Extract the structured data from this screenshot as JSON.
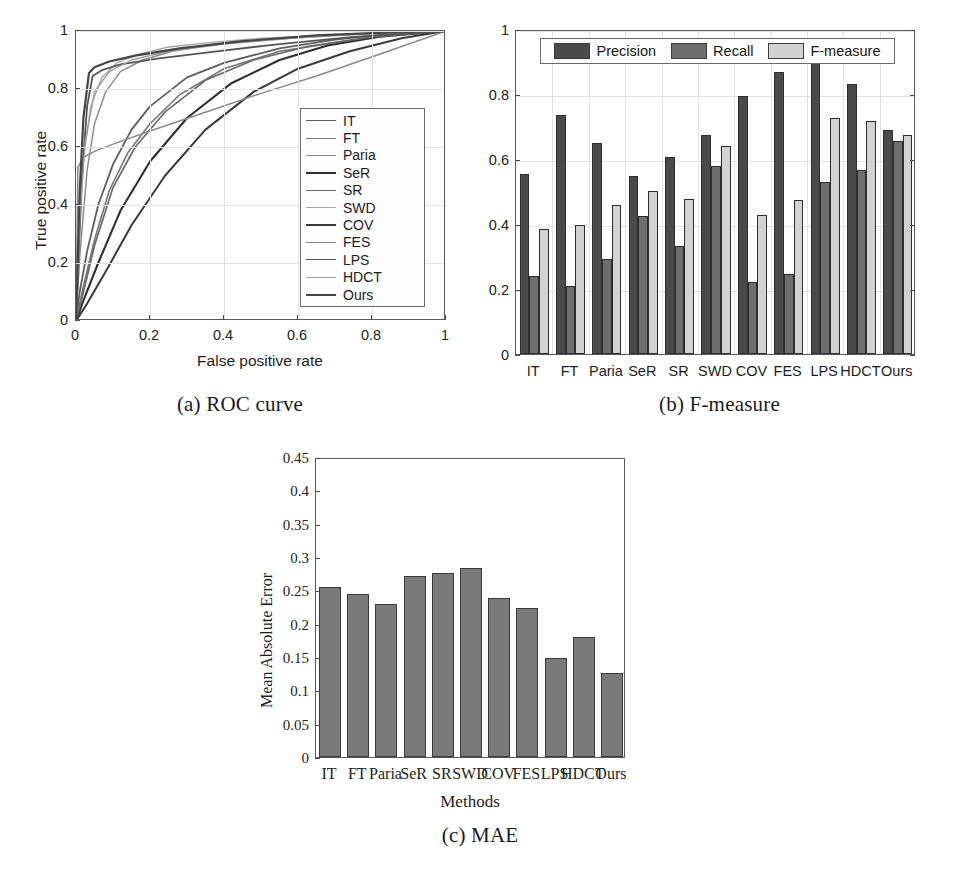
{
  "figure": {
    "panels": [
      {
        "key": "roc",
        "caption": "(a) ROC curve"
      },
      {
        "key": "fm",
        "caption": "(b) F-measure"
      },
      {
        "key": "mae",
        "caption": "(c) MAE"
      }
    ]
  },
  "colors": {
    "precision": "#4a4a4a",
    "recall": "#6e6e6e",
    "fmeasure": "#d2d2d2",
    "mae_bar": "#7a7a7a",
    "axis": "#5a5a5a",
    "grid": "#e3e3e3"
  },
  "methods": [
    "IT",
    "FT",
    "Paria",
    "SeR",
    "SR",
    "SWD",
    "COV",
    "FES",
    "LPS",
    "HDCT",
    "Ours"
  ],
  "chart_data": [
    {
      "id": "roc",
      "type": "line",
      "title": "(a) ROC curve",
      "xlabel": "False positive rate",
      "ylabel": "True positive rate",
      "xlim": [
        0,
        1
      ],
      "ylim": [
        0,
        1
      ],
      "xticks": [
        0,
        0.2,
        0.4,
        0.6,
        0.8,
        1
      ],
      "yticks": [
        0,
        0.2,
        0.4,
        0.6,
        0.8,
        1
      ],
      "xticklabels": [
        "0",
        "0.2",
        "0.4",
        "0.6",
        "0.8",
        "1"
      ],
      "yticklabels": [
        "0",
        "0.2",
        "0.4",
        "0.6",
        "0.8",
        "1"
      ],
      "grid": true,
      "legend_position": "lower right",
      "series": [
        {
          "name": "IT",
          "color": "#5e5e5e",
          "width": 1.8,
          "x": [
            0,
            0.01,
            0.03,
            0.06,
            0.1,
            0.15,
            0.2,
            0.3,
            0.4,
            0.55,
            0.7,
            0.85,
            1.0
          ],
          "y": [
            0,
            0.1,
            0.24,
            0.4,
            0.54,
            0.66,
            0.74,
            0.84,
            0.89,
            0.94,
            0.97,
            0.99,
            1.0
          ]
        },
        {
          "name": "FT",
          "color": "#777777",
          "width": 1.6,
          "x": [
            0,
            0.02,
            0.05,
            0.09,
            0.14,
            0.2,
            0.28,
            0.4,
            0.55,
            0.7,
            0.85,
            1.0
          ],
          "y": [
            0,
            0.12,
            0.28,
            0.45,
            0.58,
            0.68,
            0.78,
            0.87,
            0.93,
            0.96,
            0.985,
            1.0
          ]
        },
        {
          "name": "Paria",
          "color": "#8e8e8e",
          "width": 1.5,
          "x": [
            0,
            0.01,
            0.03,
            0.05,
            0.08,
            0.12,
            0.18,
            0.26,
            0.38,
            0.52,
            0.7,
            0.86,
            1.0
          ],
          "y": [
            0,
            0.22,
            0.52,
            0.68,
            0.79,
            0.86,
            0.9,
            0.93,
            0.955,
            0.97,
            0.985,
            0.995,
            1.0
          ]
        },
        {
          "name": "SeR",
          "color": "#2f2f2f",
          "width": 2.1,
          "x": [
            0,
            0.02,
            0.06,
            0.12,
            0.2,
            0.3,
            0.42,
            0.55,
            0.68,
            0.82,
            1.0
          ],
          "y": [
            0,
            0.07,
            0.2,
            0.38,
            0.55,
            0.7,
            0.82,
            0.9,
            0.95,
            0.98,
            1.0
          ]
        },
        {
          "name": "SR",
          "color": "#6a6a6a",
          "width": 1.7,
          "x": [
            0,
            0.02,
            0.05,
            0.1,
            0.16,
            0.24,
            0.35,
            0.48,
            0.62,
            0.8,
            1.0
          ],
          "y": [
            0,
            0.1,
            0.26,
            0.46,
            0.6,
            0.72,
            0.83,
            0.9,
            0.945,
            0.98,
            1.0
          ]
        },
        {
          "name": "SWD",
          "color": "#a8a8a8",
          "width": 1.4,
          "x": [
            0,
            0.01,
            0.02,
            0.04,
            0.07,
            0.11,
            0.17,
            0.25,
            0.36,
            0.5,
            0.68,
            0.85,
            1.0
          ],
          "y": [
            0,
            0.3,
            0.56,
            0.74,
            0.84,
            0.89,
            0.92,
            0.945,
            0.96,
            0.975,
            0.985,
            0.995,
            1.0
          ]
        },
        {
          "name": "COV",
          "color": "#3a3a3a",
          "width": 2.0,
          "x": [
            0,
            0.03,
            0.08,
            0.15,
            0.24,
            0.35,
            0.48,
            0.6,
            0.74,
            0.88,
            1.0
          ],
          "y": [
            0,
            0.06,
            0.17,
            0.33,
            0.5,
            0.66,
            0.79,
            0.87,
            0.93,
            0.975,
            1.0
          ]
        },
        {
          "name": "FES",
          "color": "#8a8a8a",
          "width": 1.5,
          "x": [
            0,
            0.005,
            0.02,
            0.05,
            0.1,
            0.2,
            0.35,
            0.5,
            0.65,
            0.82,
            1.0
          ],
          "y": [
            0,
            0.53,
            0.565,
            0.585,
            0.61,
            0.655,
            0.72,
            0.785,
            0.845,
            0.92,
            1.0
          ]
        },
        {
          "name": "LPS",
          "color": "#555555",
          "width": 1.8,
          "x": [
            0,
            0.015,
            0.03,
            0.045,
            0.07,
            0.12,
            0.22,
            0.38,
            0.55,
            0.75,
            1.0
          ],
          "y": [
            0,
            0.48,
            0.74,
            0.845,
            0.865,
            0.885,
            0.905,
            0.93,
            0.955,
            0.98,
            1.0
          ]
        },
        {
          "name": "HDCT",
          "color": "#9d9d9d",
          "width": 1.4,
          "x": [
            0,
            0.01,
            0.025,
            0.05,
            0.09,
            0.15,
            0.25,
            0.4,
            0.58,
            0.78,
            1.0
          ],
          "y": [
            0,
            0.35,
            0.62,
            0.79,
            0.86,
            0.9,
            0.93,
            0.955,
            0.975,
            0.99,
            1.0
          ]
        },
        {
          "name": "Ours",
          "color": "#454545",
          "width": 2.2,
          "x": [
            0,
            0.01,
            0.02,
            0.035,
            0.05,
            0.09,
            0.16,
            0.28,
            0.45,
            0.65,
            0.85,
            1.0
          ],
          "y": [
            0,
            0.45,
            0.7,
            0.855,
            0.875,
            0.895,
            0.915,
            0.94,
            0.965,
            0.985,
            0.995,
            1.0
          ]
        }
      ]
    },
    {
      "id": "fmeasure",
      "type": "bar",
      "title": "(b) F-measure",
      "xlabel": "",
      "ylabel": "",
      "ylim": [
        0,
        1
      ],
      "yticks": [
        0,
        0.2,
        0.4,
        0.6,
        0.8,
        1
      ],
      "yticklabels": [
        "0",
        "0.2",
        "0.4",
        "0.6",
        "0.8",
        "1"
      ],
      "grid": true,
      "legend_position": "top",
      "categories": [
        "IT",
        "FT",
        "Paria",
        "SeR",
        "SR",
        "SWD",
        "COV",
        "FES",
        "LPS",
        "HDCT",
        "Ours"
      ],
      "series": [
        {
          "name": "Precision",
          "color": "#4a4a4a",
          "values": [
            0.555,
            0.735,
            0.648,
            0.549,
            0.607,
            0.675,
            0.795,
            0.868,
            0.898,
            0.832,
            0.69
          ]
        },
        {
          "name": "Recall",
          "color": "#6e6e6e",
          "values": [
            0.24,
            0.208,
            0.291,
            0.426,
            0.332,
            0.58,
            0.222,
            0.247,
            0.528,
            0.565,
            0.655
          ]
        },
        {
          "name": "F-measure",
          "color": "#d2d2d2",
          "values": [
            0.385,
            0.396,
            0.459,
            0.502,
            0.477,
            0.639,
            0.428,
            0.474,
            0.726,
            0.718,
            0.673
          ]
        }
      ]
    },
    {
      "id": "mae",
      "type": "bar",
      "title": "(c) MAE",
      "xlabel": "Methods",
      "ylabel": "Mean Absolute Error",
      "ylim": [
        0,
        0.45
      ],
      "yticks": [
        0,
        0.05,
        0.1,
        0.15,
        0.2,
        0.25,
        0.3,
        0.35,
        0.4,
        0.45
      ],
      "yticklabels": [
        "0",
        "0.05",
        "0.1",
        "0.15",
        "0.2",
        "0.25",
        "0.3",
        "0.35",
        "0.4",
        "0.45"
      ],
      "grid": false,
      "categories": [
        "IT",
        "FT",
        "Paria",
        "SeR",
        "SR",
        "SWD",
        "COV",
        "FES",
        "LPS",
        "HDCT",
        "Ours"
      ],
      "series": [
        {
          "name": "MAE",
          "color": "#7a7a7a",
          "values": [
            0.255,
            0.245,
            0.229,
            0.272,
            0.276,
            0.283,
            0.239,
            0.223,
            0.148,
            0.18,
            0.126
          ]
        }
      ]
    }
  ]
}
